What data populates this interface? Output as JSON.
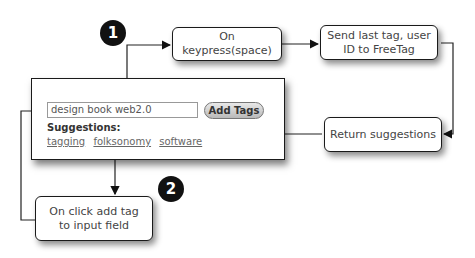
{
  "badges": [
    "1",
    "2"
  ],
  "nodes": {
    "keypress": "On keypress(space)",
    "send": "Send last tag, user ID to FreeTag",
    "return": "Return suggestions",
    "onclick": "On click add tag to input field"
  },
  "widget": {
    "input_value": "design book web2.0",
    "button_label": "Add Tags",
    "suggestions_label": "Suggestions:",
    "suggestions": [
      "tagging",
      "folksonomy",
      "software"
    ]
  }
}
